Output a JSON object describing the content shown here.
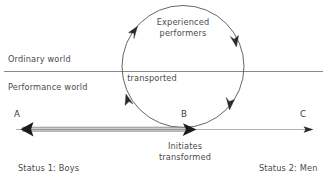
{
  "diagram": {
    "type": "process-cycle-diagram",
    "colors": {
      "stroke": "#555555",
      "text": "#4a4a4a",
      "band_dark": "#2b2b2b",
      "band_light": "#9a9a9a",
      "background": "#ffffff"
    },
    "worlds": {
      "ordinary": "Ordinary world",
      "performance": "Performance world",
      "divider_label": "transported"
    },
    "cycle": {
      "label_line1": "Experienced",
      "label_line2": "performers",
      "direction": "counterclockwise",
      "arrow_count": 4
    },
    "axis": {
      "nodes": [
        {
          "id": "A",
          "label": "A",
          "position": "left"
        },
        {
          "id": "B",
          "label": "B",
          "position": "center"
        },
        {
          "id": "C",
          "label": "C",
          "position": "right"
        }
      ],
      "transition_label_line1": "Initiates",
      "transition_label_line2": "transformed",
      "status_left": "Status 1: Boys",
      "status_right": "Status 2: Men"
    }
  }
}
